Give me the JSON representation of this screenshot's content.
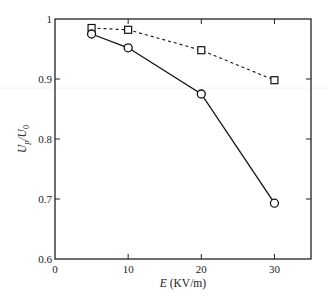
{
  "chart_data": {
    "type": "line",
    "title": "",
    "xlabel": "E (KV/m)",
    "xlabel_italic_part": "E",
    "xlabel_rest": " (KV/m)",
    "ylabel": "U_p/U_0",
    "xlim": [
      0,
      35
    ],
    "ylim": [
      0.6,
      1.0
    ],
    "xticks": [
      0,
      10,
      20,
      30
    ],
    "xtick_labels": [
      "0",
      "10",
      "20",
      "30"
    ],
    "yticks": [
      0.6,
      0.7,
      0.8,
      0.9,
      1.0
    ],
    "ytick_labels": [
      "0.6",
      "0.7",
      "0.8",
      "0.9",
      "1"
    ],
    "grid": false,
    "legend": "none",
    "x": [
      5,
      10,
      20,
      30
    ],
    "series": [
      {
        "name": "dashed-square",
        "marker": "square",
        "line_style": "dashed",
        "values": [
          0.985,
          0.982,
          0.948,
          0.898
        ]
      },
      {
        "name": "solid-circle",
        "marker": "circle",
        "line_style": "solid",
        "values": [
          0.975,
          0.952,
          0.875,
          0.693
        ]
      }
    ]
  },
  "colors": {
    "axis": "#222222",
    "series": "#111111",
    "background": "#ffffff"
  }
}
